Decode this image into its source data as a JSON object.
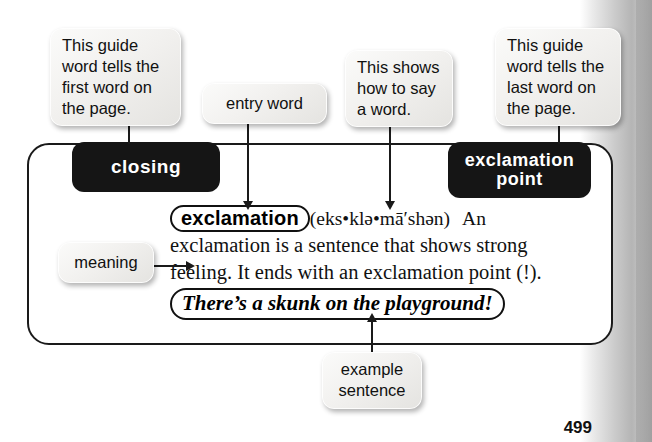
{
  "page": {
    "page_number": "499",
    "colors": {
      "ink": "#1a1a1a",
      "tab_background": "#151515",
      "tab_text": "#ffffff",
      "callout_background": "#f0efed",
      "paper": "#ffffff"
    }
  },
  "entry": {
    "guide_word_left": "closing",
    "guide_word_right": "exclamation point",
    "headword": "exclamation",
    "pronunciation": "(eks•klə•mā′shən)",
    "definition_line1": "An",
    "definition_line2": "exclamation is a sentence that shows strong",
    "definition_line3": "feeling. It ends with an exclamation point (!).",
    "example_sentence": "There’s a skunk on the playground!"
  },
  "callouts": [
    {
      "id": "guide-first",
      "text": "This guide\nword tells the\nfirst word on\nthe page."
    },
    {
      "id": "entry-word",
      "text": "entry word"
    },
    {
      "id": "pronounce",
      "text": "This shows\nhow to say\na word."
    },
    {
      "id": "guide-last",
      "text": "This guide\nword tells the\nlast word on\nthe page."
    },
    {
      "id": "meaning",
      "text": "meaning"
    },
    {
      "id": "example",
      "text": "example\nsentence"
    }
  ]
}
